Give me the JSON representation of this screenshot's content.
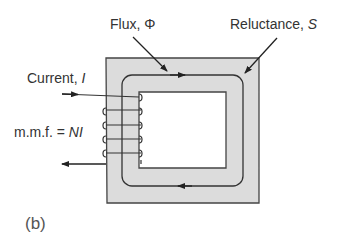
{
  "figure": {
    "panel_label": "(b)",
    "labels": {
      "flux_prefix": "Flux, ",
      "flux_symbol": "Φ",
      "reluctance_prefix": "Reluctance, ",
      "reluctance_symbol": "S",
      "current_prefix": "Current, ",
      "current_symbol": "I",
      "mmf_prefix": "m.m.f. = ",
      "mmf_symbol": "NI"
    },
    "colors": {
      "core_fill": "#dcdcdc",
      "stroke": "#333333",
      "text": "#333333"
    },
    "coil_turns": 5
  }
}
